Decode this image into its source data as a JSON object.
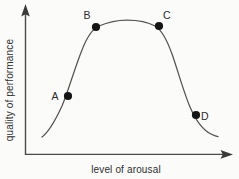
{
  "figure": {
    "background_color": "#fbfbfa",
    "axis_color": "#4a4a4a",
    "curve_color": "#55524f",
    "dot_color": "#151515"
  },
  "axes": {
    "y_label": "quality of performance",
    "x_label": "level of arousal",
    "y_arrow_icon": "arrow-up-icon",
    "x_arrow_icon": "arrow-right-icon"
  },
  "points": [
    {
      "label": "A",
      "cx": 68,
      "cy": 96,
      "label_x": 55,
      "label_y": 100
    },
    {
      "label": "B",
      "cx": 96,
      "cy": 27,
      "label_x": 87,
      "label_y": 19
    },
    {
      "label": "C",
      "cx": 159,
      "cy": 26,
      "label_x": 167,
      "label_y": 19
    },
    {
      "label": "D",
      "cx": 196,
      "cy": 115,
      "label_x": 205,
      "label_y": 120
    }
  ],
  "chart_data": {
    "type": "line",
    "title": "",
    "subtitle": "",
    "xlabel": "level of arousal",
    "ylabel": "quality of performance",
    "xlim": [
      0,
      1
    ],
    "ylim": [
      0,
      1
    ],
    "grid": false,
    "legend": "none",
    "axis_ticks": "none",
    "shape": "inverted-U with flat plateau (Yerkes-Dodson curve)",
    "series": [
      {
        "name": "performance",
        "comment": "normalized arousal (x, 0-1 left-to-right) vs performance (y, 0-1 bottom-to-top)",
        "x": [
          0.09,
          0.15,
          0.22,
          0.3,
          0.38,
          0.46,
          0.55,
          0.64,
          0.72,
          0.78,
          0.84,
          0.9,
          0.96,
          1.0
        ],
        "y": [
          0.14,
          0.22,
          0.4,
          0.63,
          0.83,
          0.91,
          0.93,
          0.93,
          0.91,
          0.8,
          0.6,
          0.38,
          0.23,
          0.18
        ]
      }
    ],
    "annotations": [
      {
        "label": "A",
        "x": 0.24,
        "y": 0.46,
        "note": "rising limb, low-moderate arousal"
      },
      {
        "label": "B",
        "x": 0.39,
        "y": 0.88,
        "note": "start of optimal plateau"
      },
      {
        "label": "C",
        "x": 0.73,
        "y": 0.89,
        "note": "end of optimal plateau"
      },
      {
        "label": "D",
        "x": 0.94,
        "y": 0.29,
        "note": "falling limb, high arousal"
      }
    ]
  }
}
